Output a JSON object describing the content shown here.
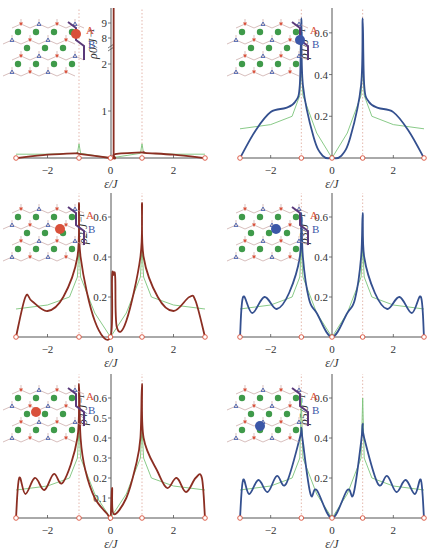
{
  "colors": {
    "site_a": "#d9503a",
    "site_b": "#3b57a8",
    "curve_a": "#8b2e22",
    "curve_b": "#34508f",
    "reference": "#7cc47a",
    "lattice_green": "#3f9a4a",
    "axis": "#555555",
    "guide_dash": "#d99a8a"
  },
  "chart_data": [
    {
      "type": "line",
      "panel": "top-left",
      "ylabel": "ρ0/J⁻¹",
      "xlabel": "ε/J",
      "xlim": [
        -3,
        3
      ],
      "xticks": [
        "-2",
        "0",
        "2"
      ],
      "yticks": [
        "1",
        "2",
        "8",
        "9"
      ],
      "y_axis_break": true,
      "site": "A",
      "inset_labels": [
        "A",
        "B"
      ],
      "series": [
        {
          "name": "site DOS",
          "color": "curve_a",
          "x": [
            -3,
            -2,
            -1.1,
            -1,
            0,
            0.15,
            0.15,
            1,
            1.1,
            2,
            3
          ],
          "y": [
            0,
            0.07,
            0.1,
            0.09,
            0,
            0,
            0.08,
            0.12,
            0.11,
            0.07,
            0
          ]
        },
        {
          "name": "bulk reference",
          "color": "reference",
          "x": [
            -3,
            -2,
            -1.05,
            -1,
            -0.95,
            0,
            0.95,
            1,
            1.05,
            2,
            3
          ],
          "y": [
            0.08,
            0.08,
            0.1,
            0.3,
            0.1,
            0,
            0.1,
            0.3,
            0.1,
            0.08,
            0.08
          ]
        }
      ],
      "annotations": [
        "delta peak at ε≈0.1 exceeding 9"
      ]
    },
    {
      "type": "line",
      "panel": "top-right",
      "ylabel": "ρ1/J⁻¹",
      "xlabel": "ε/J",
      "xlim": [
        -3,
        3
      ],
      "ylim": [
        0,
        0.7
      ],
      "xticks": [
        "-2",
        "0",
        "2"
      ],
      "yticks": [
        "0.2",
        "0.4",
        "0.6"
      ],
      "site": "B",
      "inset_labels": [
        "A",
        "B"
      ],
      "series": [
        {
          "name": "site DOS",
          "color": "curve_b",
          "x": [
            -3,
            -2.5,
            -2,
            -1.5,
            -1.2,
            -1.05,
            -1,
            -0.95,
            -0.6,
            -0.3,
            0,
            0.3,
            0.6,
            0.95,
            1,
            1.05,
            1.2,
            1.5,
            2,
            2.5,
            3
          ],
          "y": [
            0,
            0.13,
            0.22,
            0.24,
            0.27,
            0.35,
            0.67,
            0.35,
            0.1,
            0.01,
            0,
            0.01,
            0.1,
            0.35,
            0.67,
            0.35,
            0.27,
            0.24,
            0.22,
            0.13,
            0
          ]
        },
        {
          "name": "bulk reference",
          "color": "reference",
          "x": [
            -3,
            -2,
            -1.3,
            -1.05,
            -1,
            -0.95,
            -0.5,
            0,
            0.5,
            0.95,
            1,
            1.05,
            1.3,
            2,
            3
          ],
          "y": [
            0.14,
            0.16,
            0.2,
            0.3,
            0.45,
            0.3,
            0.12,
            0,
            0.12,
            0.3,
            0.45,
            0.3,
            0.2,
            0.16,
            0.14
          ]
        }
      ]
    },
    {
      "type": "line",
      "panel": "middle-left",
      "ylabel": "ρ2/J⁻¹",
      "xlabel": "ε/J",
      "xlim": [
        -3,
        3
      ],
      "ylim": [
        0,
        0.7
      ],
      "xticks": [
        "-2",
        "0",
        "2"
      ],
      "yticks": [
        "0.2",
        "0.4",
        "0.6"
      ],
      "site": "A",
      "inset_labels": [
        "A",
        "B"
      ],
      "series": [
        {
          "name": "site DOS",
          "color": "curve_a",
          "x": [
            -3,
            -2.7,
            -2.5,
            -2,
            -1.5,
            -1.05,
            -1,
            -0.95,
            -0.5,
            0,
            0.05,
            0.1,
            0.15,
            0.2,
            0.5,
            0.95,
            1,
            1.05,
            1.5,
            2,
            2.5,
            2.7,
            3
          ],
          "y": [
            0,
            0.2,
            0.18,
            0.13,
            0.2,
            0.4,
            0.67,
            0.4,
            0.08,
            0,
            0.3,
            0.31,
            0.3,
            0.05,
            0.08,
            0.4,
            0.67,
            0.4,
            0.2,
            0.13,
            0.2,
            0.18,
            0
          ]
        },
        {
          "name": "bulk reference",
          "color": "reference",
          "x": [
            -3,
            -2,
            -1.3,
            -1.05,
            -1,
            -0.95,
            -0.5,
            0,
            0.5,
            0.95,
            1,
            1.05,
            1.3,
            2,
            3
          ],
          "y": [
            0.14,
            0.16,
            0.2,
            0.3,
            0.45,
            0.3,
            0.12,
            0,
            0.12,
            0.3,
            0.45,
            0.3,
            0.2,
            0.16,
            0.14
          ]
        }
      ]
    },
    {
      "type": "line",
      "panel": "middle-right",
      "ylabel": "ρ3/J⁻¹",
      "xlabel": "ε/J",
      "xlim": [
        -3,
        3
      ],
      "ylim": [
        0,
        0.7
      ],
      "xticks": [
        "-2",
        "0",
        "2"
      ],
      "yticks": [
        "0.2",
        "0.4",
        "0.6"
      ],
      "site": "B",
      "inset_labels": [
        "A",
        "B"
      ],
      "series": [
        {
          "name": "site DOS",
          "color": "curve_b",
          "x": [
            -3,
            -2.9,
            -2.6,
            -2.2,
            -1.8,
            -1.4,
            -1.05,
            -1,
            -0.95,
            -0.75,
            -0.5,
            0,
            0.5,
            0.75,
            0.95,
            1,
            1.05,
            1.4,
            1.8,
            2.2,
            2.6,
            2.9,
            3
          ],
          "y": [
            0,
            0.2,
            0.12,
            0.2,
            0.14,
            0.22,
            0.4,
            0.62,
            0.4,
            0.19,
            0.12,
            0,
            0.12,
            0.19,
            0.4,
            0.62,
            0.4,
            0.22,
            0.14,
            0.2,
            0.12,
            0.2,
            0
          ]
        },
        {
          "name": "bulk reference",
          "color": "reference",
          "x": [
            -3,
            -2,
            -1.3,
            -1.05,
            -1,
            -0.95,
            -0.5,
            0,
            0.5,
            0.95,
            1,
            1.05,
            1.3,
            2,
            3
          ],
          "y": [
            0.14,
            0.16,
            0.2,
            0.3,
            0.45,
            0.3,
            0.12,
            0,
            0.12,
            0.3,
            0.45,
            0.3,
            0.2,
            0.16,
            0.14
          ]
        }
      ]
    },
    {
      "type": "line",
      "panel": "bottom-left",
      "ylabel": "ρ4/J⁻¹",
      "xlabel": "ε/J",
      "xlim": [
        -3,
        3
      ],
      "ylim": [
        0,
        0.7
      ],
      "xticks": [
        "-2",
        "0",
        "2"
      ],
      "yticks": [
        "0.1",
        "0.2",
        "0.3",
        "0.4",
        "0.5",
        "0.6"
      ],
      "site": "A",
      "inset_labels": [
        "A",
        "B"
      ],
      "series": [
        {
          "name": "site DOS",
          "color": "curve_a",
          "x": [
            -3,
            -2.9,
            -2.7,
            -2.4,
            -2.1,
            -1.8,
            -1.5,
            -1.05,
            -1,
            -0.95,
            -0.8,
            -0.5,
            -0.1,
            0,
            0.05,
            0.1,
            0.5,
            0.8,
            0.95,
            1,
            1.05,
            1.5,
            1.8,
            2.1,
            2.4,
            2.7,
            2.9,
            3
          ],
          "y": [
            0,
            0.2,
            0.12,
            0.2,
            0.14,
            0.22,
            0.18,
            0.4,
            0.67,
            0.4,
            0.24,
            0.1,
            0.02,
            0,
            0.15,
            0.02,
            0.1,
            0.26,
            0.4,
            0.67,
            0.4,
            0.23,
            0.15,
            0.2,
            0.13,
            0.2,
            0.2,
            0
          ]
        },
        {
          "name": "bulk reference",
          "color": "reference",
          "x": [
            -3,
            -2,
            -1.3,
            -1.05,
            -1,
            -0.95,
            -0.5,
            0,
            0.5,
            0.95,
            1,
            1.05,
            1.3,
            2,
            3
          ],
          "y": [
            0.14,
            0.16,
            0.2,
            0.3,
            0.45,
            0.3,
            0.12,
            0,
            0.12,
            0.3,
            0.45,
            0.3,
            0.2,
            0.16,
            0.14
          ]
        }
      ]
    },
    {
      "type": "line",
      "panel": "bottom-right",
      "ylabel": "ρ5/J⁻¹",
      "xlabel": "ε/J",
      "xlim": [
        -3,
        3
      ],
      "ylim": [
        0,
        0.7
      ],
      "xticks": [
        "-2",
        "0",
        "2"
      ],
      "yticks": [
        "0.2",
        "0.4",
        "0.6"
      ],
      "site": "B",
      "inset_labels": [
        "A",
        "B"
      ],
      "series": [
        {
          "name": "site DOS",
          "color": "curve_b",
          "x": [
            -3,
            -2.9,
            -2.7,
            -2.4,
            -2.1,
            -1.8,
            -1.5,
            -1.05,
            -1,
            -0.95,
            -0.7,
            -0.5,
            0,
            0.5,
            0.7,
            0.95,
            1,
            1.05,
            1.5,
            1.8,
            2.1,
            2.4,
            2.7,
            2.9,
            3
          ],
          "y": [
            0,
            0.19,
            0.12,
            0.19,
            0.13,
            0.21,
            0.17,
            0.4,
            0.45,
            0.38,
            0.12,
            0.14,
            0,
            0.14,
            0.12,
            0.38,
            0.47,
            0.4,
            0.17,
            0.21,
            0.13,
            0.19,
            0.12,
            0.19,
            0
          ]
        },
        {
          "name": "bulk reference",
          "color": "reference",
          "x": [
            -3,
            -2,
            -1.3,
            -1.05,
            -1,
            -0.95,
            -0.5,
            0,
            0.5,
            0.95,
            1,
            1.05,
            1.3,
            2,
            3
          ],
          "y": [
            0.14,
            0.16,
            0.2,
            0.3,
            0.6,
            0.3,
            0.12,
            0,
            0.12,
            0.3,
            0.6,
            0.3,
            0.2,
            0.16,
            0.14
          ]
        }
      ]
    }
  ]
}
